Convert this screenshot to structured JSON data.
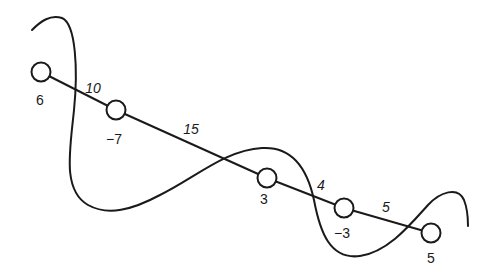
{
  "diagram": {
    "type": "weighted-path-graph-with-cut-curve",
    "stroke_color": "#1a1a1a",
    "background": "#ffffff",
    "nodes": [
      {
        "id": "n1",
        "label": "6",
        "cx": 41,
        "cy": 72,
        "lx": 40,
        "ly": 100
      },
      {
        "id": "n2",
        "label": "−7",
        "cx": 116,
        "cy": 110,
        "lx": 114,
        "ly": 139
      },
      {
        "id": "n3",
        "label": "3",
        "cx": 267,
        "cy": 178,
        "lx": 264,
        "ly": 199
      },
      {
        "id": "n4",
        "label": "−3",
        "cx": 344,
        "cy": 208,
        "lx": 342,
        "ly": 233
      },
      {
        "id": "n5",
        "label": "5",
        "cx": 431,
        "cy": 233,
        "lx": 431,
        "ly": 258
      }
    ],
    "edges": [
      {
        "from": "n1",
        "to": "n2",
        "weight": "10",
        "lx": 93,
        "ly": 88
      },
      {
        "from": "n2",
        "to": "n3",
        "weight": "15",
        "lx": 191,
        "ly": 129
      },
      {
        "from": "n3",
        "to": "n4",
        "weight": "4",
        "lx": 321,
        "ly": 185
      },
      {
        "from": "n4",
        "to": "n5",
        "weight": "5",
        "lx": 386,
        "ly": 207
      }
    ],
    "curve_path": "M32,30 C40,22 50,14 62,18 C76,24 78,70 74,110 C70,150 62,190 88,205 C108,216 132,210 160,195 C195,178 225,150 262,148 C295,146 308,172 314,200 C320,232 330,260 360,256 C388,252 410,225 428,205 C440,192 458,186 464,200 C468,210 468,220 468,226"
  }
}
